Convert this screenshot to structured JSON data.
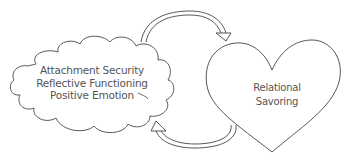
{
  "diagram": {
    "type": "cycle",
    "nodes": [
      {
        "id": "cloud",
        "shape": "cloud",
        "lines": [
          "Attachment Security",
          "Reflective Functioning",
          "Positive Emotion"
        ]
      },
      {
        "id": "heart",
        "shape": "heart",
        "lines": [
          "Relational",
          "Savoring"
        ]
      }
    ],
    "edges": [
      {
        "from": "cloud",
        "to": "heart",
        "position": "top",
        "style": "double-line curved arrow"
      },
      {
        "from": "heart",
        "to": "cloud",
        "position": "bottom",
        "style": "double-line curved arrow"
      }
    ],
    "colors": {
      "stroke": "#444444",
      "text": "#555555",
      "background": "#ffffff"
    }
  }
}
